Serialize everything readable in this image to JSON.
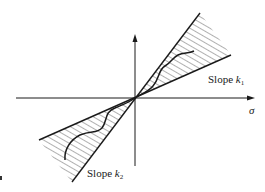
{
  "diagram": {
    "type": "sector-bound nonlinearity",
    "axes": {
      "horizontal_label": "σ",
      "vertical_label": ""
    },
    "labels": {
      "slope_upper": {
        "prefix": "Slope ",
        "var": "k",
        "sub": "1"
      },
      "slope_lower": {
        "prefix": "Slope ",
        "var": "k",
        "sub": "2"
      }
    },
    "colors": {
      "line": "#1a1a1a",
      "hatch": "#3a3a3a",
      "background": "#ffffff"
    },
    "geometry": {
      "origin": [
        135,
        98
      ],
      "h_axis": {
        "x1": 16,
        "x2": 255,
        "y": 98
      },
      "v_axis": {
        "x": 135,
        "y1": 34,
        "y2": 166
      },
      "upper_wedge": {
        "steep_end": [
          200,
          13
        ],
        "shallow_end": [
          231,
          55
        ]
      },
      "lower_wedge": {
        "shallow_end": [
          39,
          140
        ],
        "steep_end": [
          72,
          182
        ]
      }
    }
  }
}
